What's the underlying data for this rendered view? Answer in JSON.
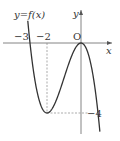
{
  "chart_data": {
    "type": "line",
    "title": "y=f(x)",
    "xlabel": "x",
    "ylabel": "y",
    "origin_label": "O",
    "function": "f(x) = -x^3 - 3x^2",
    "x_ticks": [
      {
        "value": -3,
        "label": "−3"
      },
      {
        "value": -2,
        "label": "−2"
      }
    ],
    "y_ticks": [
      {
        "value": -4,
        "label": "−4"
      }
    ],
    "key_points": [
      {
        "x": -3,
        "y": 0,
        "note": "x-intercept"
      },
      {
        "x": -2,
        "y": -4,
        "note": "local minimum"
      },
      {
        "x": 0,
        "y": 0,
        "note": "local maximum / origin"
      }
    ],
    "x": [
      -3.2,
      -3,
      -2.5,
      -2,
      -1.5,
      -1,
      -0.5,
      0,
      0.5,
      1.05
    ],
    "values": [
      2.05,
      0,
      -3.125,
      -4,
      -3.375,
      -2,
      -0.625,
      0,
      -0.875,
      -4.47
    ],
    "xlim": [
      -3.6,
      1.3
    ],
    "ylim": [
      -5.2,
      2.5
    ],
    "grid": false,
    "guides": [
      "dashed vertical from (-2,0) to (-2,-4)",
      "dashed horizontal from (-2,-4) to (0,-4)"
    ]
  },
  "labels": {
    "curve": "y=f(x)",
    "y_axis": "y",
    "x_axis": "x",
    "origin": "O",
    "xtick_neg3": "−3",
    "xtick_neg2": "−2",
    "ytick_neg4": "−4"
  }
}
